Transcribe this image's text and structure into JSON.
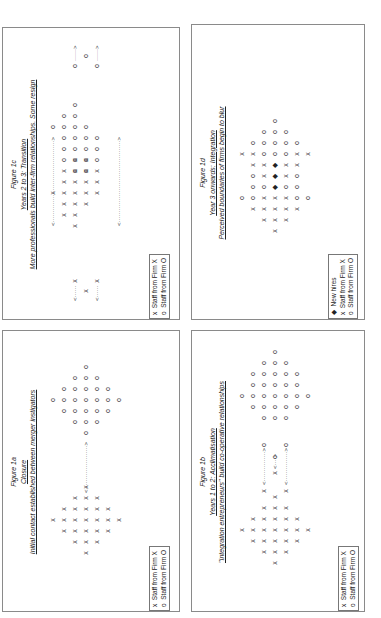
{
  "legend": {
    "x_label": "Staff from Firm X",
    "o_label": "Staff from Firm O",
    "new_hires_label": "New hires",
    "x_symbol": "x",
    "o_symbol": "o",
    "dot_symbol": "◆"
  },
  "figures": {
    "fig1a": {
      "number": "Figure 1a",
      "phase": "Closure",
      "description": "Initial contact established between merger instigators"
    },
    "fig1b": {
      "number": "Figure 1b",
      "phase": "Years 1 to 2: Acclimatisation",
      "description": "\"Integration entrepreneurs\" build co-operative relationships"
    },
    "fig1c": {
      "number": "Figure 1c",
      "phase": "Years 2 to 3: Transition",
      "description": "More professionals build inter-firm relationships. Some resign"
    },
    "fig1d": {
      "number": "Figure 1d",
      "phase": "Year 3 onwards: Integration",
      "description": "Perceived boundaries of firms begin to blur"
    }
  },
  "colors": {
    "border": "#8a8a8a",
    "text": "#222222"
  }
}
